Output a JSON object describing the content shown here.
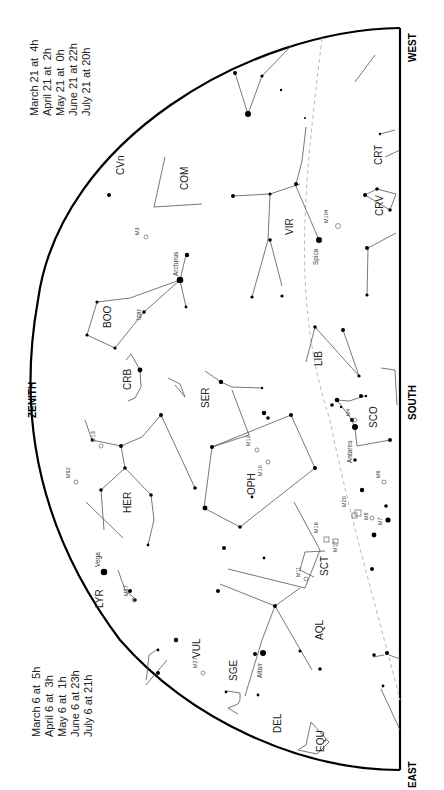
{
  "map": {
    "directions": {
      "west": "WEST",
      "south": "SOUTH",
      "east": "EAST",
      "zenith": "ZENITH"
    },
    "times_west": [
      "March 21 at  4h",
      "April 21 at  2h",
      "May 21 at  0h",
      "June 21 at 22h",
      "July 21 at 20h"
    ],
    "times_east": [
      "March 6 at  5h",
      "April 6 at  3h",
      "May 6 at  1h",
      "June 6 at 23h",
      "July 6 at 21h"
    ],
    "constellations": [
      "CRT",
      "CRV",
      "COM",
      "VIR",
      "BOO",
      "CRB",
      "SER",
      "LIB",
      "SCO",
      "HER",
      "OPH",
      "SCT",
      "AQL",
      "VUL",
      "SGE",
      "DEL",
      "EQU",
      "LYR",
      "CVn"
    ],
    "stars": [
      "Arcturus",
      "Izar",
      "Spica",
      "Antares",
      "Vega",
      "Altair"
    ],
    "messier": [
      "M3",
      "M104",
      "M13",
      "M92",
      "M12",
      "M10",
      "M4",
      "M6",
      "M7",
      "M8",
      "M20",
      "M16",
      "M17",
      "M11",
      "M57",
      "M27"
    ],
    "colors": {
      "frame": "#000000",
      "lines": "#555555",
      "ecliptic": "#bbbbbb"
    }
  }
}
